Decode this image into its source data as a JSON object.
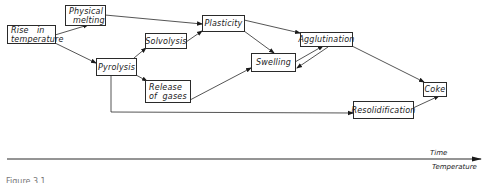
{
  "diagram": {
    "type": "process-flow",
    "nodes": [
      {
        "id": "rise",
        "label": "Rise in temperature",
        "lines": [
          "Rise   in",
          "temperature"
        ]
      },
      {
        "id": "melting",
        "label": "Physical melting",
        "lines": [
          "Physical",
          "melting"
        ]
      },
      {
        "id": "pyrolysis",
        "label": "Pyrolysis",
        "lines": [
          "Pyrolysis"
        ]
      },
      {
        "id": "solvolysis",
        "label": "Solvolysis",
        "lines": [
          "Solvolysis"
        ]
      },
      {
        "id": "gases",
        "label": "Release of gases",
        "lines": [
          "Release",
          "of  gases"
        ]
      },
      {
        "id": "plasticity",
        "label": "Plasticity",
        "lines": [
          "Plasticity"
        ]
      },
      {
        "id": "swelling",
        "label": "Swelling",
        "lines": [
          "Swelling"
        ]
      },
      {
        "id": "agglutination",
        "label": "Agglutination",
        "lines": [
          "Agglutination"
        ]
      },
      {
        "id": "resolidification",
        "label": "Resolidification",
        "lines": [
          "Resolidification"
        ]
      },
      {
        "id": "coke",
        "label": "Coke",
        "lines": [
          "Coke"
        ]
      }
    ],
    "edges": [
      {
        "from": "rise",
        "to": "melting"
      },
      {
        "from": "rise",
        "to": "pyrolysis"
      },
      {
        "from": "melting",
        "to": "plasticity"
      },
      {
        "from": "pyrolysis",
        "to": "solvolysis"
      },
      {
        "from": "pyrolysis",
        "to": "gases"
      },
      {
        "from": "pyrolysis",
        "to": "resolidification"
      },
      {
        "from": "solvolysis",
        "to": "plasticity"
      },
      {
        "from": "plasticity",
        "to": "swelling"
      },
      {
        "from": "plasticity",
        "to": "agglutination"
      },
      {
        "from": "gases",
        "to": "swelling"
      },
      {
        "from": "swelling",
        "to": "agglutination"
      },
      {
        "from": "agglutination",
        "to": "swelling"
      },
      {
        "from": "agglutination",
        "to": "coke"
      },
      {
        "from": "resolidification",
        "to": "coke"
      }
    ]
  },
  "axis": {
    "label_top": "Time",
    "label_bottom": "Temperature"
  },
  "caption": "Figure 3.1"
}
